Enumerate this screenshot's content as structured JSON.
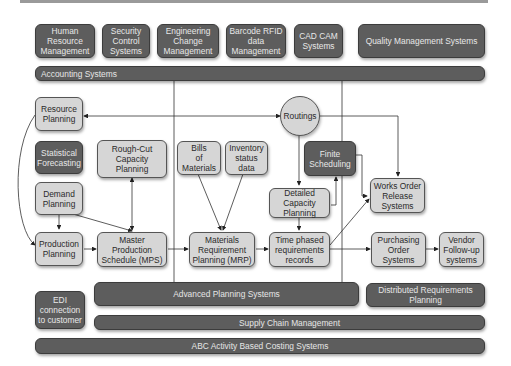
{
  "top_systems": [
    {
      "label": "Human\nResource\nManagement"
    },
    {
      "label": "Security\nControl\nSystems"
    },
    {
      "label": "Engineering\nChange\nManagement"
    },
    {
      "label": "Barcode RFID\ndata\nManagement"
    },
    {
      "label": "CAD CAM\nSystems"
    },
    {
      "label": "Quality Management Systems"
    }
  ],
  "bars": {
    "accounting": "Accounting Systems",
    "advanced_planning": "Advanced Planning Systems",
    "distributed_requirements": "Distributed Requirements\nPlanning",
    "supply_chain": "Supply Chain Management",
    "abc_costing": "ABC Activity Based Costing Systems"
  },
  "nodes": {
    "resource_planning": "Resource\nPlanning",
    "statistical_forecasting": "Statistical\nForecasting",
    "demand_planning": "Demand\nPlanning",
    "production_planning": "Production\nPlanning",
    "rough_cut": "Rough-Cut\nCapacity\nPlanning",
    "mps": "Master\nProduction\nSchedule (MPS)",
    "bom": "Bills\nof\nMaterials",
    "inventory": "Inventory\nstatus\ndata",
    "mrp": "Materials\nRequirement\nPlanning (MRP)",
    "routings": "Routings",
    "finite_scheduling": "Finite\nScheduling",
    "detailed_capacity": "Detailed\nCapacity\nPlanning",
    "time_phased": "Time phased\nrequirements\nrecords",
    "works_order": "Works Order\nRelease\nSystems",
    "purchasing": "Purchasing\nOrder\nSystems",
    "vendor": "Vendor\nFollow-up\nsystems",
    "edi": "EDI\nconnection\nto customer"
  }
}
